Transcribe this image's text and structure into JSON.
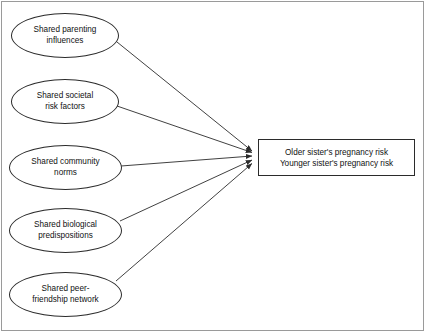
{
  "diagram": {
    "nodes": [
      {
        "id": "parenting",
        "shape": "ellipse",
        "label": "Shared parenting\ninfluences",
        "x": 11,
        "y": 13,
        "w": 108,
        "h": 45
      },
      {
        "id": "societal",
        "shape": "ellipse",
        "label": "Shared societal\nrisk factors",
        "x": 11,
        "y": 79,
        "w": 108,
        "h": 45
      },
      {
        "id": "community",
        "shape": "ellipse",
        "label": "Shared community\nnorms",
        "x": 9,
        "y": 145,
        "w": 113,
        "h": 45
      },
      {
        "id": "biological",
        "shape": "ellipse",
        "label": "Shared biological\npredispositions",
        "x": 9,
        "y": 208,
        "w": 113,
        "h": 45
      },
      {
        "id": "peer",
        "shape": "ellipse",
        "label": "Shared peer-\nfriendship network",
        "x": 9,
        "y": 272,
        "w": 113,
        "h": 45
      },
      {
        "id": "outcome",
        "shape": "rect",
        "label": "Older sister's pregnancy risk\nYounger sister's pregnancy risk",
        "x": 258,
        "y": 139,
        "w": 157,
        "h": 37
      }
    ],
    "edges": [
      {
        "from": "parenting",
        "to": "outcome",
        "x1": 117,
        "y1": 42,
        "x2": 255,
        "y2": 152
      },
      {
        "from": "societal",
        "to": "outcome",
        "x1": 117,
        "y1": 106,
        "x2": 255,
        "y2": 153
      },
      {
        "from": "community",
        "to": "outcome",
        "x1": 121,
        "y1": 166,
        "x2": 255,
        "y2": 156
      },
      {
        "from": "biological",
        "to": "outcome",
        "x1": 120,
        "y1": 221,
        "x2": 255,
        "y2": 160
      },
      {
        "from": "peer",
        "to": "outcome",
        "x1": 116,
        "y1": 281,
        "x2": 255,
        "y2": 163
      }
    ],
    "colors": {
      "stroke": "#2b2b2b",
      "frame": "#9a9a9a",
      "background": "#ffffff",
      "text": "#111111"
    }
  }
}
